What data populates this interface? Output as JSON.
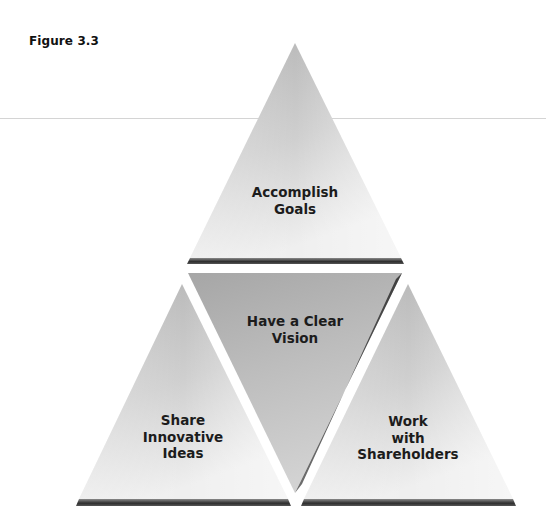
{
  "figure": {
    "label": "Figure 3.3"
  },
  "triangles": [
    {
      "id": "top",
      "orientation": "up",
      "lines": [
        "Accomplish",
        "Goals"
      ]
    },
    {
      "id": "center",
      "orientation": "down",
      "lines": [
        "Have a Clear",
        "Vision"
      ]
    },
    {
      "id": "left",
      "orientation": "up",
      "lines": [
        "Share",
        "Innovative",
        "Ideas"
      ]
    },
    {
      "id": "right",
      "orientation": "up",
      "lines": [
        "Work",
        "with",
        "Shareholders"
      ]
    }
  ],
  "colors": {
    "fill_light": "#ececec",
    "fill_dark": "#a9a9a9",
    "edge_dark": "#3a3a3a",
    "text": "#1c1c1c",
    "divider_line": "#d4d4d4"
  }
}
